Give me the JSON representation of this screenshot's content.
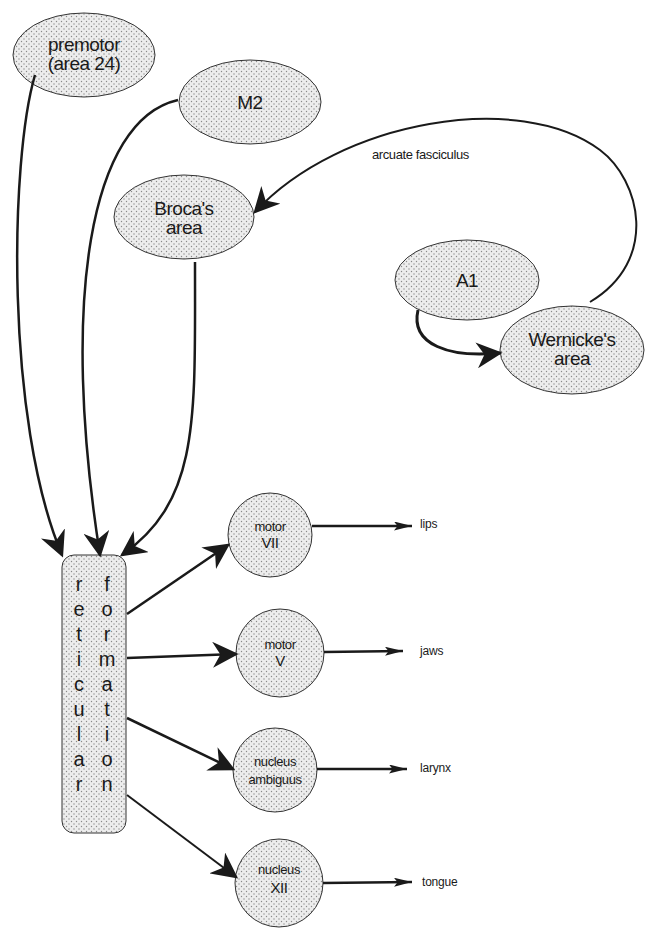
{
  "diagram": {
    "colors": {
      "stroke": "#1a1a1a",
      "fill": "#ececec",
      "dot": "#8a8a8a",
      "background": "#ffffff"
    },
    "cortical_nodes": [
      {
        "id": "premotor",
        "lines": [
          "premotor",
          "(area 24)"
        ]
      },
      {
        "id": "m2",
        "lines": [
          "M2"
        ]
      },
      {
        "id": "broca",
        "lines": [
          "Broca's",
          "area"
        ]
      },
      {
        "id": "a1",
        "lines": [
          "A1"
        ]
      },
      {
        "id": "wernicke",
        "lines": [
          "Wernicke's",
          "area"
        ]
      }
    ],
    "pathway_label": "arcuate fasciculus",
    "reticular_formation": {
      "word1": [
        "r",
        "e",
        "t",
        "i",
        "c",
        "u",
        "l",
        "a",
        "r"
      ],
      "word2": [
        "f",
        "o",
        "r",
        "m",
        "a",
        "t",
        "i",
        "o",
        "n"
      ]
    },
    "motor_nuclei": [
      {
        "id": "motor-vii",
        "lines": [
          "motor",
          "VII"
        ],
        "target": "lips"
      },
      {
        "id": "motor-v",
        "lines": [
          "motor",
          "V"
        ],
        "target": "jaws"
      },
      {
        "id": "nucleus-ambiguus",
        "lines": [
          "nucleus",
          "ambiguus"
        ],
        "target": "larynx"
      },
      {
        "id": "nucleus-xii",
        "lines": [
          "nucleus",
          "XII"
        ],
        "target": "tongue"
      }
    ],
    "edges": [
      {
        "from": "premotor",
        "to": "reticular formation"
      },
      {
        "from": "M2",
        "to": "reticular formation"
      },
      {
        "from": "Broca's area",
        "to": "reticular formation"
      },
      {
        "from": "Wernicke's area",
        "to": "Broca's area",
        "label": "arcuate fasciculus"
      },
      {
        "from": "A1",
        "to": "Wernicke's area"
      },
      {
        "from": "reticular formation",
        "to": "motor VII"
      },
      {
        "from": "reticular formation",
        "to": "motor V"
      },
      {
        "from": "reticular formation",
        "to": "nucleus ambiguus"
      },
      {
        "from": "reticular formation",
        "to": "nucleus XII"
      },
      {
        "from": "motor VII",
        "to": "lips"
      },
      {
        "from": "motor V",
        "to": "jaws"
      },
      {
        "from": "nucleus ambiguus",
        "to": "larynx"
      },
      {
        "from": "nucleus XII",
        "to": "tongue"
      }
    ]
  }
}
